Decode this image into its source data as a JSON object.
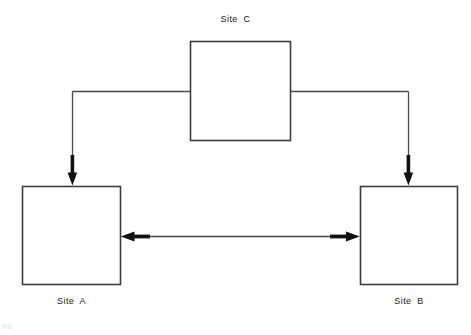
{
  "diagram": {
    "background_color": "#ffffff",
    "line_color": "#3c3c3c",
    "arrow_color": "#111111",
    "text_color": "#1a1a1a",
    "nodes": [
      {
        "id": "site-c",
        "label": "Site  C",
        "label_position": "above",
        "x": 190,
        "y": 41,
        "width": 100,
        "height": 99
      },
      {
        "id": "site-a",
        "label": "Site  A",
        "label_position": "below",
        "x": 22,
        "y": 186,
        "width": 99,
        "height": 99
      },
      {
        "id": "site-b",
        "label": "Site  B",
        "label_position": "below",
        "x": 360,
        "y": 186,
        "width": 98,
        "height": 99
      }
    ],
    "connections": [
      {
        "id": "conn-c-to-a",
        "from": "site-c",
        "to": "site-a",
        "style": "elbow",
        "arrowheads": "end",
        "direction": "down"
      },
      {
        "id": "conn-c-to-b",
        "from": "site-c",
        "to": "site-b",
        "style": "elbow",
        "arrowheads": "end",
        "direction": "down"
      },
      {
        "id": "conn-a-to-b",
        "from": "site-a",
        "to": "site-b",
        "style": "straight",
        "arrowheads": "both",
        "direction": "horizontal"
      }
    ]
  }
}
